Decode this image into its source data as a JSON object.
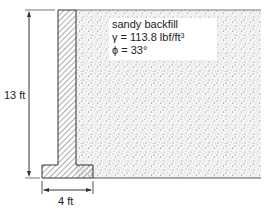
{
  "diagram": {
    "type": "retaining-wall cross-section",
    "height_label": "13 ft",
    "base_width_label": "4 ft",
    "backfill": {
      "title": "sandy backfill",
      "unit_weight_symbol": "γ",
      "unit_weight_value": "113.8 lbf/ft",
      "unit_weight_exponent": "3",
      "friction_angle_symbol": "ϕ",
      "friction_angle_value": "33°"
    },
    "colors": {
      "line": "#333333",
      "hatch": "#555555",
      "fill_dots": "#777777"
    }
  }
}
